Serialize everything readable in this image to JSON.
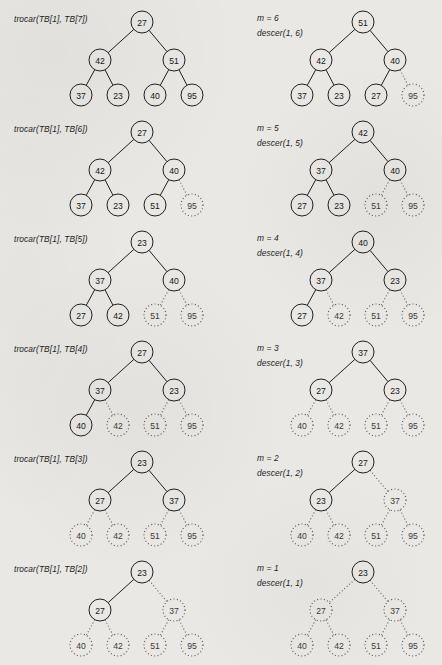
{
  "figure": {
    "kind": "heapsort-trace",
    "background_color": "#e9e8e5",
    "ink_color": "#151515",
    "columns": 2,
    "rows": 6,
    "legend": {
      "solid_meaning": "node still part of the heap",
      "dotted_meaning": "node removed from the heap (sorted region)"
    }
  },
  "panels": [
    {
      "id": "panel-1-left",
      "caption": "trocar(TB[1], TB[7])",
      "caption2": "",
      "nodes": [
        {
          "label": "27",
          "style": "solid"
        },
        {
          "label": "42",
          "style": "solid"
        },
        {
          "label": "51",
          "style": "solid"
        },
        {
          "label": "37",
          "style": "solid"
        },
        {
          "label": "23",
          "style": "solid"
        },
        {
          "label": "40",
          "style": "solid"
        },
        {
          "label": "95",
          "style": "solid"
        }
      ]
    },
    {
      "id": "panel-1-right",
      "caption": "m = 6",
      "caption2": "descer(1, 6)",
      "nodes": [
        {
          "label": "51",
          "style": "solid"
        },
        {
          "label": "42",
          "style": "solid"
        },
        {
          "label": "40",
          "style": "solid"
        },
        {
          "label": "37",
          "style": "solid"
        },
        {
          "label": "23",
          "style": "solid"
        },
        {
          "label": "27",
          "style": "solid"
        },
        {
          "label": "95",
          "style": "dotted"
        }
      ]
    },
    {
      "id": "panel-2-left",
      "caption": "trocar(TB[1], TB[6])",
      "caption2": "",
      "nodes": [
        {
          "label": "27",
          "style": "solid"
        },
        {
          "label": "42",
          "style": "solid"
        },
        {
          "label": "40",
          "style": "solid"
        },
        {
          "label": "37",
          "style": "solid"
        },
        {
          "label": "23",
          "style": "solid"
        },
        {
          "label": "51",
          "style": "solid"
        },
        {
          "label": "95",
          "style": "dotted"
        }
      ]
    },
    {
      "id": "panel-2-right",
      "caption": "m = 5",
      "caption2": "descer(1, 5)",
      "nodes": [
        {
          "label": "42",
          "style": "solid"
        },
        {
          "label": "37",
          "style": "solid"
        },
        {
          "label": "40",
          "style": "solid"
        },
        {
          "label": "27",
          "style": "solid"
        },
        {
          "label": "23",
          "style": "solid"
        },
        {
          "label": "51",
          "style": "dotted"
        },
        {
          "label": "95",
          "style": "dotted"
        }
      ]
    },
    {
      "id": "panel-3-left",
      "caption": "trocar(TB[1], TB[5])",
      "caption2": "",
      "nodes": [
        {
          "label": "23",
          "style": "solid"
        },
        {
          "label": "37",
          "style": "solid"
        },
        {
          "label": "40",
          "style": "solid"
        },
        {
          "label": "27",
          "style": "solid"
        },
        {
          "label": "42",
          "style": "solid"
        },
        {
          "label": "51",
          "style": "dotted"
        },
        {
          "label": "95",
          "style": "dotted"
        }
      ]
    },
    {
      "id": "panel-3-right",
      "caption": "m = 4",
      "caption2": "descer(1, 4)",
      "nodes": [
        {
          "label": "40",
          "style": "solid"
        },
        {
          "label": "37",
          "style": "solid"
        },
        {
          "label": "23",
          "style": "solid"
        },
        {
          "label": "27",
          "style": "solid"
        },
        {
          "label": "42",
          "style": "dotted"
        },
        {
          "label": "51",
          "style": "dotted"
        },
        {
          "label": "95",
          "style": "dotted"
        }
      ]
    },
    {
      "id": "panel-4-left",
      "caption": "trocar(TB[1], TB[4])",
      "caption2": "",
      "nodes": [
        {
          "label": "27",
          "style": "solid"
        },
        {
          "label": "37",
          "style": "solid"
        },
        {
          "label": "23",
          "style": "solid"
        },
        {
          "label": "40",
          "style": "solid"
        },
        {
          "label": "42",
          "style": "dotted"
        },
        {
          "label": "51",
          "style": "dotted"
        },
        {
          "label": "95",
          "style": "dotted"
        }
      ]
    },
    {
      "id": "panel-4-right",
      "caption": "m = 3",
      "caption2": "descer(1, 3)",
      "nodes": [
        {
          "label": "37",
          "style": "solid"
        },
        {
          "label": "27",
          "style": "solid"
        },
        {
          "label": "23",
          "style": "solid"
        },
        {
          "label": "40",
          "style": "dotted"
        },
        {
          "label": "42",
          "style": "dotted"
        },
        {
          "label": "51",
          "style": "dotted"
        },
        {
          "label": "95",
          "style": "dotted"
        }
      ]
    },
    {
      "id": "panel-5-left",
      "caption": "trocar(TB[1], TB[3])",
      "caption2": "",
      "nodes": [
        {
          "label": "23",
          "style": "solid"
        },
        {
          "label": "27",
          "style": "solid"
        },
        {
          "label": "37",
          "style": "solid"
        },
        {
          "label": "40",
          "style": "dotted"
        },
        {
          "label": "42",
          "style": "dotted"
        },
        {
          "label": "51",
          "style": "dotted"
        },
        {
          "label": "95",
          "style": "dotted"
        }
      ]
    },
    {
      "id": "panel-5-right",
      "caption": "m = 2",
      "caption2": "descer(1, 2)",
      "nodes": [
        {
          "label": "27",
          "style": "solid"
        },
        {
          "label": "23",
          "style": "solid"
        },
        {
          "label": "37",
          "style": "dotted"
        },
        {
          "label": "40",
          "style": "dotted"
        },
        {
          "label": "42",
          "style": "dotted"
        },
        {
          "label": "51",
          "style": "dotted"
        },
        {
          "label": "95",
          "style": "dotted"
        }
      ]
    },
    {
      "id": "panel-6-left",
      "caption": "trocar(TB[1], TB[2])",
      "caption2": "",
      "nodes": [
        {
          "label": "23",
          "style": "solid"
        },
        {
          "label": "27",
          "style": "solid"
        },
        {
          "label": "37",
          "style": "dotted"
        },
        {
          "label": "40",
          "style": "dotted"
        },
        {
          "label": "42",
          "style": "dotted"
        },
        {
          "label": "51",
          "style": "dotted"
        },
        {
          "label": "95",
          "style": "dotted"
        }
      ]
    },
    {
      "id": "panel-6-right",
      "caption": "m = 1",
      "caption2": "descer(1, 1)",
      "nodes": [
        {
          "label": "23",
          "style": "solid"
        },
        {
          "label": "27",
          "style": "dotted"
        },
        {
          "label": "37",
          "style": "dotted"
        },
        {
          "label": "40",
          "style": "dotted"
        },
        {
          "label": "42",
          "style": "dotted"
        },
        {
          "label": "51",
          "style": "dotted"
        },
        {
          "label": "95",
          "style": "dotted"
        }
      ]
    }
  ]
}
